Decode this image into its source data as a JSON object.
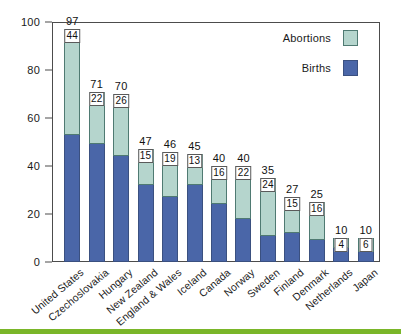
{
  "chart_data": {
    "type": "bar",
    "subtype": "stacked-bar",
    "title": "",
    "xlabel": "",
    "ylabel": "",
    "ylim": [
      0,
      100
    ],
    "yticks": [
      0,
      20,
      40,
      60,
      80,
      100
    ],
    "grid": false,
    "legend_position": "top-right",
    "categories": [
      "United States",
      "Czechoslovakia",
      "Hungary",
      "New Zealand",
      "England & Wales",
      "Iceland",
      "Canada",
      "Norway",
      "Sweden",
      "Finland",
      "Denmark",
      "Netherlands",
      "Japan"
    ],
    "series": [
      {
        "name": "Births",
        "color": "#4a66a8",
        "values": [
          53,
          49,
          44,
          32,
          27,
          32,
          24,
          18,
          11,
          12,
          9,
          6,
          4
        ]
      },
      {
        "name": "Abortions",
        "color": "#b5d5cd",
        "values": [
          44,
          22,
          26,
          15,
          19,
          13,
          16,
          22,
          24,
          15,
          16,
          4,
          6
        ]
      }
    ],
    "totals": [
      97,
      71,
      70,
      47,
      46,
      45,
      40,
      40,
      35,
      27,
      25,
      10,
      10
    ]
  },
  "legend": {
    "items": [
      {
        "label": "Abortions",
        "swatch": "abortions"
      },
      {
        "label": "Births",
        "swatch": "births"
      }
    ]
  },
  "colors": {
    "abortions": "#b5d5cd",
    "abortions_border": "#4f7a72",
    "births": "#4a66a8",
    "births_border": "#3a5080",
    "axis": "#4c4c4c",
    "accent_band": "#7ab629",
    "background": "#ffffff"
  }
}
